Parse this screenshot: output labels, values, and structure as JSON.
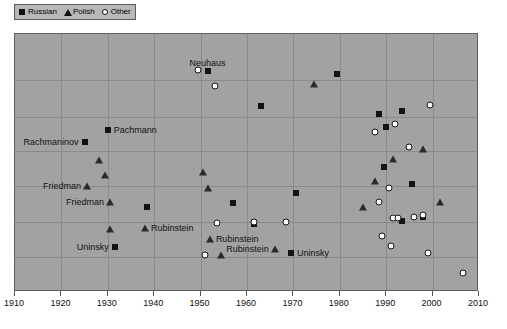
{
  "legend": {
    "entries": [
      {
        "label": "Russian",
        "marker": "square-icon"
      },
      {
        "label": "Polish",
        "marker": "triangle-icon"
      },
      {
        "label": "Other",
        "marker": "circle-icon"
      }
    ]
  },
  "colors": {
    "plot_background": "#a2a2a2",
    "gridline": "#8a8a8a",
    "marker": "#141414",
    "page_background": "#ffffff",
    "legend_background": "#b8b8b8"
  },
  "chart_data": {
    "type": "scatter",
    "title": "",
    "xlabel": "",
    "ylabel": "",
    "xlim": [
      1910,
      2010
    ],
    "ylim": [
      0,
      1
    ],
    "xticks": [
      1910,
      1920,
      1930,
      1940,
      1950,
      1960,
      1970,
      1980,
      1990,
      2000,
      2010
    ],
    "yticks": [],
    "grid": true,
    "legend_position": "top-left-outside",
    "series": [
      {
        "name": "Russian",
        "marker": "square",
        "points": [
          {
            "x": 1930.0,
            "y": 0.628,
            "label": "Pachmann",
            "label_pos": "right"
          },
          {
            "x": 1925.0,
            "y": 0.58,
            "label": "Rachmaninov",
            "label_pos": "left"
          },
          {
            "x": 1931.5,
            "y": 0.175,
            "label": "Uninsky",
            "label_pos": "left"
          },
          {
            "x": 1938.5,
            "y": 0.33,
            "label": "",
            "label_pos": ""
          },
          {
            "x": 1951.5,
            "y": 0.855,
            "label": "Neuhaus",
            "label_pos": "above"
          },
          {
            "x": 1957.0,
            "y": 0.345,
            "label": "",
            "label_pos": ""
          },
          {
            "x": 1963.0,
            "y": 0.72,
            "label": "",
            "label_pos": ""
          },
          {
            "x": 1961.5,
            "y": 0.265,
            "label": "",
            "label_pos": ""
          },
          {
            "x": 1969.5,
            "y": 0.152,
            "label": "Uninsky",
            "label_pos": "right"
          },
          {
            "x": 1970.5,
            "y": 0.385,
            "label": "",
            "label_pos": ""
          },
          {
            "x": 1979.5,
            "y": 0.845,
            "label": "",
            "label_pos": ""
          },
          {
            "x": 1988.5,
            "y": 0.69,
            "label": "",
            "label_pos": ""
          },
          {
            "x": 1990.0,
            "y": 0.64,
            "label": "",
            "label_pos": ""
          },
          {
            "x": 1993.5,
            "y": 0.7,
            "label": "",
            "label_pos": ""
          },
          {
            "x": 1989.5,
            "y": 0.485,
            "label": "",
            "label_pos": ""
          },
          {
            "x": 1993.5,
            "y": 0.275,
            "label": "",
            "label_pos": ""
          },
          {
            "x": 1998.0,
            "y": 0.29,
            "label": "",
            "label_pos": ""
          },
          {
            "x": 1995.5,
            "y": 0.42,
            "label": "",
            "label_pos": ""
          }
        ]
      },
      {
        "name": "Polish",
        "marker": "triangle",
        "points": [
          {
            "x": 1928.0,
            "y": 0.51,
            "label": "",
            "label_pos": ""
          },
          {
            "x": 1929.5,
            "y": 0.455,
            "label": "",
            "label_pos": ""
          },
          {
            "x": 1925.5,
            "y": 0.41,
            "label": "Friedman",
            "label_pos": "left"
          },
          {
            "x": 1930.5,
            "y": 0.35,
            "label": "Friedman",
            "label_pos": "left"
          },
          {
            "x": 1930.5,
            "y": 0.243,
            "label": "",
            "label_pos": ""
          },
          {
            "x": 1938.0,
            "y": 0.248,
            "label": "Rubinstein",
            "label_pos": "right"
          },
          {
            "x": 1950.5,
            "y": 0.465,
            "label": "",
            "label_pos": ""
          },
          {
            "x": 1951.5,
            "y": 0.403,
            "label": "",
            "label_pos": ""
          },
          {
            "x": 1952.0,
            "y": 0.205,
            "label": "Rubinstein",
            "label_pos": "right"
          },
          {
            "x": 1954.5,
            "y": 0.145,
            "label": "",
            "label_pos": ""
          },
          {
            "x": 1966.0,
            "y": 0.165,
            "label": "Rubinstein",
            "label_pos": "left"
          },
          {
            "x": 1974.5,
            "y": 0.805,
            "label": "",
            "label_pos": ""
          },
          {
            "x": 1987.5,
            "y": 0.43,
            "label": "",
            "label_pos": ""
          },
          {
            "x": 1985.0,
            "y": 0.33,
            "label": "",
            "label_pos": ""
          },
          {
            "x": 1991.5,
            "y": 0.515,
            "label": "",
            "label_pos": ""
          },
          {
            "x": 1998.0,
            "y": 0.555,
            "label": "",
            "label_pos": ""
          },
          {
            "x": 2001.5,
            "y": 0.35,
            "label": "",
            "label_pos": ""
          }
        ]
      },
      {
        "name": "Other",
        "marker": "circle",
        "points": [
          {
            "x": 1949.5,
            "y": 0.862,
            "label": "",
            "label_pos": ""
          },
          {
            "x": 1953.0,
            "y": 0.8,
            "label": "",
            "label_pos": ""
          },
          {
            "x": 1953.5,
            "y": 0.268,
            "label": "",
            "label_pos": ""
          },
          {
            "x": 1951.0,
            "y": 0.145,
            "label": "",
            "label_pos": ""
          },
          {
            "x": 1961.5,
            "y": 0.272,
            "label": "",
            "label_pos": ""
          },
          {
            "x": 1968.5,
            "y": 0.27,
            "label": "",
            "label_pos": ""
          },
          {
            "x": 1987.5,
            "y": 0.62,
            "label": "",
            "label_pos": ""
          },
          {
            "x": 1992.0,
            "y": 0.65,
            "label": "",
            "label_pos": ""
          },
          {
            "x": 1990.5,
            "y": 0.405,
            "label": "",
            "label_pos": ""
          },
          {
            "x": 1991.5,
            "y": 0.285,
            "label": "",
            "label_pos": ""
          },
          {
            "x": 1992.5,
            "y": 0.285,
            "label": "",
            "label_pos": ""
          },
          {
            "x": 1996.0,
            "y": 0.29,
            "label": "",
            "label_pos": ""
          },
          {
            "x": 1998.0,
            "y": 0.3,
            "label": "",
            "label_pos": ""
          },
          {
            "x": 1995.0,
            "y": 0.562,
            "label": "",
            "label_pos": ""
          },
          {
            "x": 1988.5,
            "y": 0.35,
            "label": "",
            "label_pos": ""
          },
          {
            "x": 1989.0,
            "y": 0.218,
            "label": "",
            "label_pos": ""
          },
          {
            "x": 1991.0,
            "y": 0.178,
            "label": "",
            "label_pos": ""
          },
          {
            "x": 1999.0,
            "y": 0.15,
            "label": "",
            "label_pos": ""
          },
          {
            "x": 2006.5,
            "y": 0.075,
            "label": "",
            "label_pos": ""
          },
          {
            "x": 1999.5,
            "y": 0.725,
            "label": "",
            "label_pos": ""
          }
        ]
      }
    ],
    "gridlines": {
      "vertical_x": [
        1920,
        1930,
        1940,
        1950,
        1960,
        1970,
        1980,
        1990,
        2000
      ],
      "horizontal_y": [
        0.135,
        0.27,
        0.41,
        0.545,
        0.68,
        0.82
      ]
    }
  }
}
